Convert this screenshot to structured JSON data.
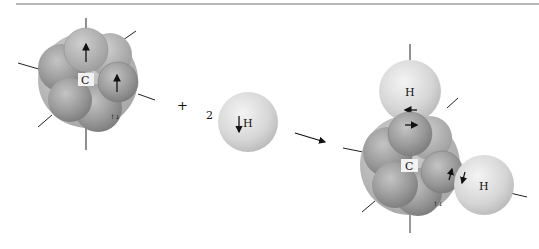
{
  "figure": {
    "reaction": "C (carbon, 4 sp3 half-filled orbitals) + 2 H -> CH2 with 2 unpaired orbitals",
    "reactant_carbon": {
      "label": "C",
      "electron_arrows": [
        "up",
        "up"
      ]
    },
    "plus_sign": "+",
    "coefficient": "2",
    "reactant_hydrogen": {
      "label": "H",
      "spin_arrow": "↓"
    },
    "reaction_arrow": "→",
    "product": {
      "center_label": "C",
      "hydrogen_labels": [
        "H",
        "H"
      ],
      "bond_spin_pairs": [
        "←/→",
        "↑/↓"
      ]
    }
  },
  "colors": {
    "background": "#ffffff",
    "rule": "#b8b8b8",
    "orbital_dark": "#8a8a8a",
    "orbital_mid": "#a6a6a6",
    "hydrogen_sphere": "#d9d9d9",
    "line": "#222222"
  }
}
